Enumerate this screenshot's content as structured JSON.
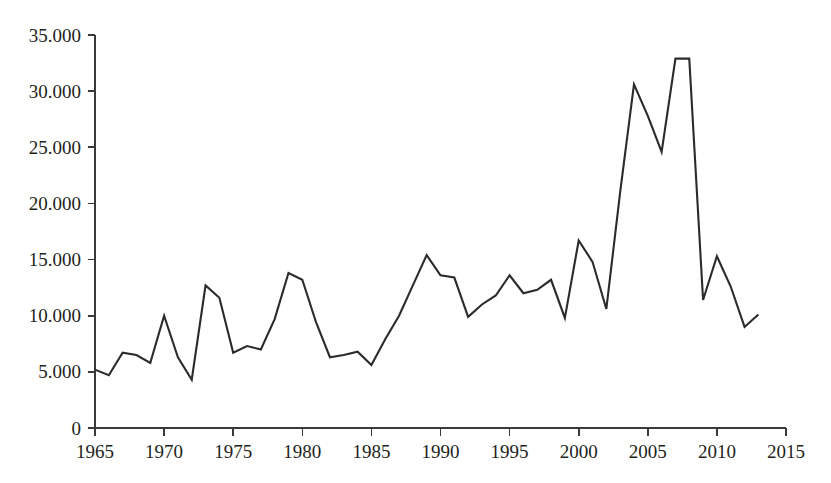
{
  "chart_data": {
    "type": "line",
    "title": "",
    "xlabel": "",
    "ylabel": "",
    "xlim": [
      1965,
      2015
    ],
    "ylim": [
      0,
      35000
    ],
    "grid": false,
    "legend": null,
    "number_format": "European thousands separator (dot)",
    "x_tick_labels": [
      "1965",
      "1970",
      "1975",
      "1980",
      "1985",
      "1990",
      "1995",
      "2000",
      "2005",
      "2010",
      "2015"
    ],
    "x_tick_values": [
      1965,
      1970,
      1975,
      1980,
      1985,
      1990,
      1995,
      2000,
      2005,
      2010,
      2015
    ],
    "y_tick_labels": [
      "0",
      "5.000",
      "10.000",
      "15.000",
      "20.000",
      "25.000",
      "30.000",
      "35.000"
    ],
    "y_tick_values": [
      0,
      5000,
      10000,
      15000,
      20000,
      25000,
      30000,
      35000
    ],
    "x": [
      1965,
      1966,
      1967,
      1968,
      1969,
      1970,
      1971,
      1972,
      1973,
      1974,
      1975,
      1976,
      1977,
      1978,
      1979,
      1980,
      1981,
      1982,
      1983,
      1984,
      1985,
      1986,
      1987,
      1988,
      1989,
      1990,
      1991,
      1992,
      1993,
      1994,
      1995,
      1996,
      1997,
      1998,
      1999,
      2000,
      2001,
      2002,
      2003,
      2004,
      2005,
      2006,
      2007,
      2008,
      2009,
      2010,
      2011,
      2012,
      2013
    ],
    "values": [
      5200,
      4700,
      6700,
      6500,
      5800,
      10000,
      6300,
      4300,
      12700,
      11600,
      6700,
      7300,
      7000,
      9700,
      13800,
      13200,
      9400,
      6300,
      6500,
      6800,
      5600,
      7900,
      10000,
      12700,
      15400,
      13600,
      13400,
      9900,
      11000,
      11800,
      13600,
      12000,
      12300,
      13200,
      9800,
      16700,
      14800,
      10600,
      21000,
      30600,
      27800,
      24600,
      32900,
      32900,
      11400,
      15300,
      12600,
      9000,
      10100
    ],
    "series": [
      {
        "name": "series-1",
        "color": "#2c2a2b",
        "values": [
          5200,
          4700,
          6700,
          6500,
          5800,
          10000,
          6300,
          4300,
          12700,
          11600,
          6700,
          7300,
          7000,
          9700,
          13800,
          13200,
          9400,
          6300,
          6500,
          6800,
          5600,
          7900,
          10000,
          12700,
          15400,
          13600,
          13400,
          9900,
          11000,
          11800,
          13600,
          12000,
          12300,
          13200,
          9800,
          16700,
          14800,
          10600,
          21000,
          30600,
          27800,
          24600,
          32900,
          32900,
          11400,
          15300,
          12600,
          9000,
          10100
        ]
      }
    ],
    "annotations": [],
    "colors": {
      "line": "#2c2a2b",
      "axis": "#3a3a3a",
      "text": "#231f20",
      "background": "#ffffff"
    }
  },
  "layout": {
    "plot_left_px": 95,
    "plot_right_px": 786,
    "plot_top_px": 35,
    "plot_bottom_px": 428
  }
}
